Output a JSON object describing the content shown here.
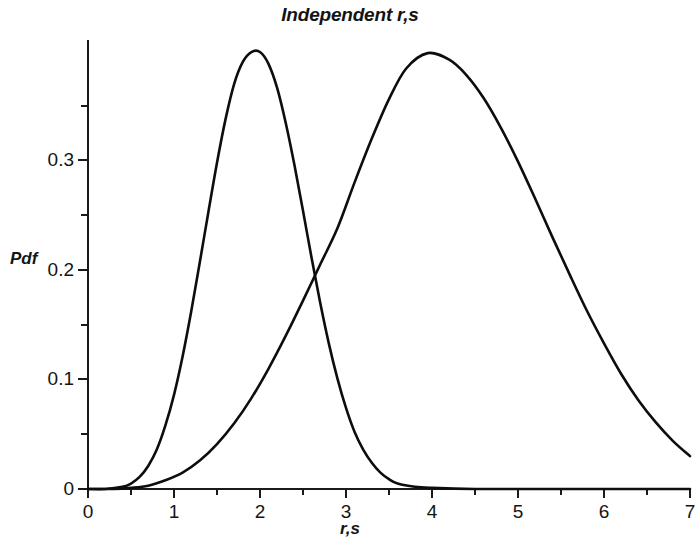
{
  "chart_data": {
    "type": "line",
    "title": "Independent r,s",
    "xlabel": "r,s",
    "ylabel": "Pdf",
    "xlim": [
      0,
      7
    ],
    "ylim": [
      0,
      0.41
    ],
    "grid": false,
    "legend": "none",
    "xticks": [
      0,
      1,
      2,
      3,
      4,
      5,
      6,
      7
    ],
    "xtick_labels": [
      "0",
      "1",
      "2",
      "3",
      "4",
      "5",
      "6",
      "7"
    ],
    "xticks_minor": [
      0.5,
      1.5,
      2.5,
      3.5,
      4.5,
      5.5,
      6.5
    ],
    "yticks": [
      0,
      0.1,
      0.2,
      0.3
    ],
    "ytick_labels": [
      "0",
      "0.1",
      "0.2",
      "0.3"
    ],
    "yticks_minor": [
      0.05,
      0.15,
      0.25,
      0.35
    ],
    "annotations": {
      "crossing_point": {
        "x": 2.65,
        "y": 0.17
      }
    },
    "series": [
      {
        "name": "r",
        "peak_x": 2.0,
        "peak_y": 0.399,
        "x": [
          0.0,
          0.2,
          0.4,
          0.5,
          0.6,
          0.7,
          0.8,
          0.9,
          1.0,
          1.1,
          1.2,
          1.3,
          1.4,
          1.5,
          1.6,
          1.7,
          1.8,
          1.9,
          2.0,
          2.1,
          2.2,
          2.3,
          2.4,
          2.5,
          2.6,
          2.7,
          2.8,
          2.9,
          3.0,
          3.1,
          3.2,
          3.3,
          3.4,
          3.5,
          3.6,
          3.8,
          4.0,
          4.5,
          5.0,
          6.0,
          7.0
        ],
        "values": [
          0.0,
          0.0,
          0.002,
          0.005,
          0.011,
          0.021,
          0.036,
          0.058,
          0.086,
          0.121,
          0.162,
          0.207,
          0.253,
          0.298,
          0.338,
          0.37,
          0.39,
          0.399,
          0.399,
          0.388,
          0.366,
          0.334,
          0.296,
          0.254,
          0.211,
          0.17,
          0.133,
          0.101,
          0.074,
          0.052,
          0.036,
          0.024,
          0.015,
          0.009,
          0.005,
          0.002,
          0.001,
          0.0,
          0.0,
          0.0,
          0.0
        ]
      },
      {
        "name": "s",
        "peak_x": 3.95,
        "peak_y": 0.398,
        "x": [
          0.0,
          0.3,
          0.5,
          0.7,
          0.9,
          1.1,
          1.3,
          1.5,
          1.7,
          1.9,
          2.1,
          2.3,
          2.5,
          2.7,
          2.9,
          3.1,
          3.3,
          3.5,
          3.7,
          3.95,
          4.2,
          4.4,
          4.6,
          4.8,
          5.0,
          5.2,
          5.4,
          5.6,
          5.8,
          6.0,
          6.2,
          6.4,
          6.6,
          6.8,
          7.0
        ],
        "values": [
          0.0,
          0.0,
          0.001,
          0.003,
          0.008,
          0.015,
          0.026,
          0.041,
          0.06,
          0.083,
          0.11,
          0.14,
          0.172,
          0.205,
          0.238,
          0.28,
          0.32,
          0.356,
          0.384,
          0.398,
          0.392,
          0.378,
          0.357,
          0.33,
          0.299,
          0.265,
          0.23,
          0.196,
          0.163,
          0.133,
          0.105,
          0.081,
          0.061,
          0.044,
          0.03
        ]
      }
    ]
  },
  "axis_geometry": {
    "plot_left_px": 88,
    "plot_right_px": 690,
    "plot_bottom_px": 489,
    "plot_top_px": 40
  },
  "colors": {
    "background": "#ffffff",
    "axis": "#1a1a1a",
    "curve": "#0d0d0d",
    "text": "#141414"
  }
}
